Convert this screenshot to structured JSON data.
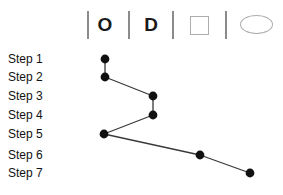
{
  "chart_data": {
    "type": "line",
    "title": "",
    "xlabel": "",
    "ylabel": "",
    "orientation": "vertical-steps",
    "categories": [
      "Step 1",
      "Step 2",
      "Step 3",
      "Step 4",
      "Step 5",
      "Step 6",
      "Step 7"
    ],
    "column_headers": [
      "O",
      "D",
      "square",
      "ellipse"
    ],
    "values": [
      1,
      1,
      2,
      2,
      1,
      3,
      4
    ],
    "points": [
      {
        "step": "Step 1",
        "column": "O",
        "x": 105,
        "y": 59
      },
      {
        "step": "Step 2",
        "column": "O",
        "x": 105,
        "y": 77
      },
      {
        "step": "Step 3",
        "column": "D",
        "x": 153,
        "y": 96
      },
      {
        "step": "Step 4",
        "column": "D",
        "x": 153,
        "y": 115
      },
      {
        "step": "Step 5",
        "column": "O",
        "x": 104,
        "y": 134
      },
      {
        "step": "Step 6",
        "column": "square",
        "x": 200,
        "y": 155
      },
      {
        "step": "Step 7",
        "column": "ellipse",
        "x": 250,
        "y": 173
      }
    ],
    "legend": [],
    "grid": false,
    "marker_color": "#111111",
    "line_color": "#3a3a3a",
    "divider_color": "#8b8b8b",
    "shape_outline_color": "#adadad"
  },
  "header": {
    "columns": [
      {
        "name": "operation-column",
        "symbol": "O",
        "type": "letter",
        "x": 104
      },
      {
        "name": "delay-column",
        "symbol": "D",
        "type": "letter",
        "x": 150
      },
      {
        "name": "inspection-column",
        "symbol": "square",
        "type": "square",
        "x": 190
      },
      {
        "name": "storage-column",
        "symbol": "ellipse",
        "type": "ellipse",
        "x": 241
      }
    ],
    "dividers": [
      87,
      128,
      172,
      225
    ]
  },
  "steps": {
    "items": [
      {
        "label": "Step 1",
        "y": 52
      },
      {
        "label": "Step 2",
        "y": 70
      },
      {
        "label": "Step 3",
        "y": 89
      },
      {
        "label": "Step 4",
        "y": 108
      },
      {
        "label": "Step 5",
        "y": 127
      },
      {
        "label": "Step 6",
        "y": 148
      },
      {
        "label": "Step 7",
        "y": 166
      }
    ]
  }
}
